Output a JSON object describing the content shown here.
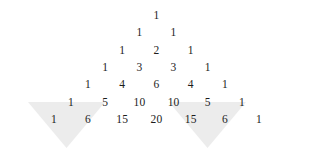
{
  "figure": {
    "name": "pascals-triangle-with-highlighted-subtriangles",
    "background_color": "#ffffff",
    "text_color": "#1c1c1c",
    "highlight_color": "#ececec"
  },
  "chart_data": {
    "type": "table",
    "title": "",
    "subtitle": "",
    "xlabel": "",
    "ylabel": "",
    "layout": {
      "apex_x": 156.5,
      "row_start_y": 16,
      "row_spacing": 17.3,
      "column_spacing": 34.2,
      "grid": false,
      "legend": "none"
    },
    "rows": [
      {
        "index": 0,
        "values": [
          1
        ]
      },
      {
        "index": 1,
        "values": [
          1,
          1
        ]
      },
      {
        "index": 2,
        "values": [
          1,
          2,
          1
        ]
      },
      {
        "index": 3,
        "values": [
          1,
          3,
          3,
          1
        ]
      },
      {
        "index": 4,
        "values": [
          1,
          4,
          6,
          4,
          1
        ]
      },
      {
        "index": 5,
        "values": [
          1,
          5,
          10,
          10,
          5,
          1
        ]
      },
      {
        "index": 6,
        "values": [
          1,
          6,
          15,
          20,
          15,
          6,
          1
        ]
      }
    ],
    "highlights": [
      {
        "name": "left-inverted-triangle",
        "color": "#ececec",
        "orientation": "point-down",
        "covers": [
          {
            "row": 5,
            "col": 0,
            "value": 1
          },
          {
            "row": 5,
            "col": 1,
            "value": 5
          },
          {
            "row": 6,
            "col": 1,
            "value": 6
          }
        ],
        "polygon": "28,102 105,102 66.5,148"
      },
      {
        "name": "right-inverted-triangle",
        "color": "#ececec",
        "orientation": "point-down",
        "covers": [
          {
            "row": 5,
            "col": 3,
            "value": 10
          },
          {
            "row": 5,
            "col": 4,
            "value": 5
          },
          {
            "row": 6,
            "col": 4,
            "value": 15
          }
        ],
        "polygon": "169,102 246,102 207.5,148"
      }
    ]
  }
}
